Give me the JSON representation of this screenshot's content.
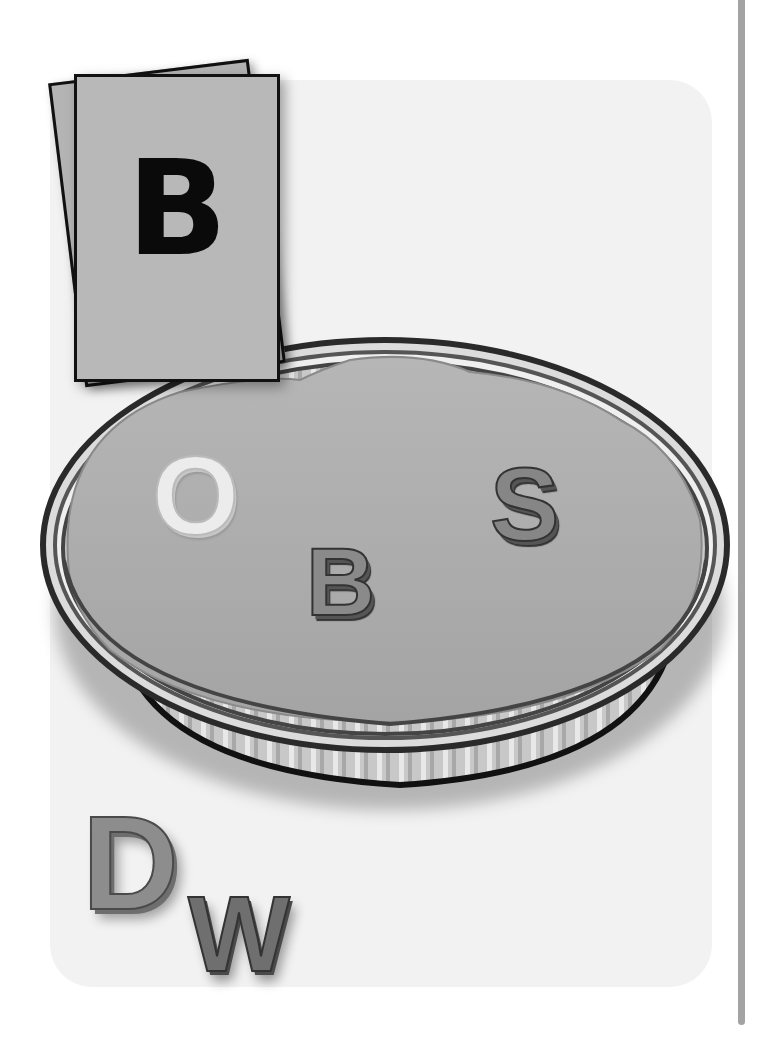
{
  "card": {
    "letter": "B"
  },
  "dish": {
    "letters": [
      {
        "char": "O",
        "style": "light"
      },
      {
        "char": "B",
        "style": "dark"
      },
      {
        "char": "S",
        "style": "dark"
      }
    ]
  },
  "bottom_letters": {
    "first": "D",
    "second": "W"
  },
  "colors": {
    "background": "#ffffff",
    "panel": "#f2f2f2",
    "card": "#b8b8b8",
    "dough": "#b0b0b0",
    "divider": "#a3a3a3"
  }
}
